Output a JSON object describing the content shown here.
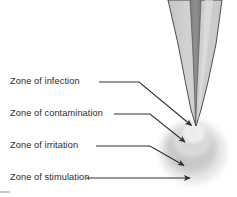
{
  "figure": {
    "background_color": "#ffffff",
    "width": 237,
    "height": 197
  },
  "instrument": {
    "name": "ultrasonic-scaler-tip",
    "body_color": "#cbcbcb",
    "stripe_color": "#8a8a8a",
    "outline_color": "#3a3a3a",
    "apex": {
      "x": 195,
      "y": 126
    }
  },
  "zones": [
    {
      "id": "infection",
      "label": "Zone of infection",
      "color": "#ededed",
      "radius": 11,
      "center": {
        "x": 194,
        "y": 134
      },
      "label_position": {
        "x": 10,
        "y": 76
      },
      "arrow": {
        "tail_x": 99,
        "tail_y": 82,
        "elbow_x": 139,
        "elbow_y": 82,
        "tip_x": 193,
        "tip_y": 127
      }
    },
    {
      "id": "contamination",
      "label": "Zone of contamination",
      "color": "#d9d9d9",
      "radius": 18,
      "center": {
        "x": 192,
        "y": 141
      },
      "label_position": {
        "x": 10,
        "y": 108
      },
      "arrow": {
        "tail_x": 112,
        "tail_y": 114,
        "elbow_x": 148,
        "elbow_y": 114,
        "tip_x": 187,
        "tip_y": 143
      }
    },
    {
      "id": "irritation",
      "label": "Zone of irritation",
      "color": "#c6c6c6",
      "radius": 26,
      "center": {
        "x": 191,
        "y": 149
      },
      "label_position": {
        "x": 10,
        "y": 140
      },
      "arrow": {
        "tail_x": 96,
        "tail_y": 146,
        "elbow_x": 148,
        "elbow_y": 146,
        "tip_x": 186,
        "tip_y": 167
      }
    },
    {
      "id": "stimulation",
      "label": "Zone of stimulation",
      "color": "#e4e4e4",
      "radius": 34,
      "center": {
        "x": 193,
        "y": 152
      },
      "label_position": {
        "x": 10,
        "y": 172
      },
      "arrow": {
        "tail_x": 86,
        "tail_y": 178,
        "elbow_x": 86,
        "elbow_y": 178,
        "tip_x": 192,
        "tip_y": 178
      }
    }
  ],
  "annotations": {
    "arrow_color": "#2f2f2f",
    "arrow_width": 1.1
  }
}
